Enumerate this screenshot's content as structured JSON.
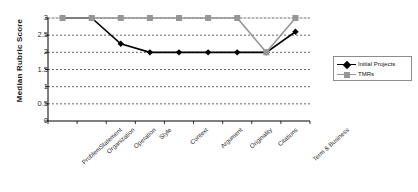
{
  "chart_data": {
    "type": "line",
    "title": "",
    "xlabel": "",
    "ylabel": "Median Rubric Score",
    "ylim": [
      0,
      3
    ],
    "yticks": [
      0,
      0.5,
      1,
      1.5,
      2,
      2.5,
      3
    ],
    "ytick_labels": [
      "0",
      "0.5",
      "1",
      "1.5",
      "2",
      "2.5",
      "3"
    ],
    "grid": true,
    "legend_position": "right",
    "categories": [
      "ProblemStatement",
      "Organization",
      "Operation",
      "Style",
      "Context",
      "Argument",
      "Originality",
      "Citations",
      "Term & Business"
    ],
    "series": [
      {
        "name": "Initial Projects",
        "color": "#000000",
        "marker": "diamond",
        "values": [
          3,
          3,
          2.25,
          2,
          2,
          2,
          2,
          2,
          2.6
        ]
      },
      {
        "name": "TMRs",
        "color": "#969696",
        "marker": "square",
        "values": [
          3,
          3,
          3,
          3,
          3,
          3,
          3,
          2,
          3
        ]
      }
    ]
  },
  "legend": {
    "items": [
      {
        "label": "Initial Projects"
      },
      {
        "label": "TMRs"
      }
    ]
  },
  "colors": {
    "series_initial": "#000000",
    "series_tmrs": "#969696",
    "grid": "#555555",
    "axis": "#000000"
  }
}
